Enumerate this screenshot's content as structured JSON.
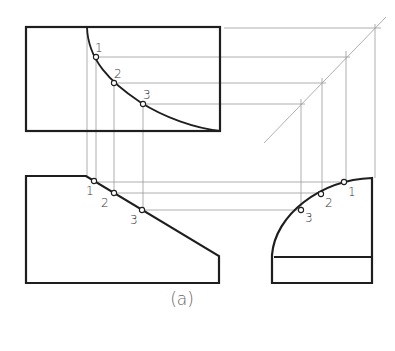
{
  "figure": {
    "caption": "(a)",
    "point_labels": [
      "1",
      "2",
      "3"
    ],
    "views": {
      "top": {
        "name": "top-view",
        "labels": {
          "p1": "1",
          "p2": "2",
          "p3": "3"
        }
      },
      "front": {
        "name": "front-view",
        "labels": {
          "p1": "1",
          "p2": "2",
          "p3": "3"
        }
      },
      "side": {
        "name": "right-side-view",
        "labels": {
          "p1": "1",
          "p2": "2",
          "p3": "3"
        }
      }
    },
    "colors": {
      "object_line": "#1e1e1e",
      "projection_line": "#9a9a9a",
      "background": "#ffffff"
    }
  }
}
